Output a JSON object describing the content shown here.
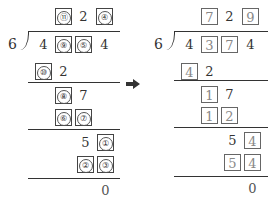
{
  "left": {
    "divisor": "6",
    "quotient": [
      "⑪",
      "2",
      "④"
    ],
    "quotient_boxed": [
      true,
      false,
      true
    ],
    "dividend": [
      "4",
      "⑨",
      "⑤",
      "4"
    ],
    "dividend_boxed": [
      false,
      true,
      true,
      false
    ],
    "step1": [
      "⑩",
      "2"
    ],
    "step1_boxed": [
      true,
      false
    ],
    "step2": [
      "⑧",
      "7"
    ],
    "step2_boxed": [
      true,
      false
    ],
    "step3": [
      "⑥",
      "⑦"
    ],
    "step3_boxed": [
      true,
      true
    ],
    "step4": [
      "5",
      "①"
    ],
    "step4_boxed": [
      false,
      true
    ],
    "step5": [
      "②",
      "③"
    ],
    "step5_boxed": [
      true,
      true
    ],
    "remainder": "0"
  },
  "arrow": {
    "icon": "right-arrow-icon",
    "color": "#333333"
  },
  "right": {
    "divisor": "6",
    "quotient": [
      "7",
      "2",
      "9"
    ],
    "quotient_boxed": [
      true,
      false,
      true
    ],
    "dividend": [
      "4",
      "3",
      "7",
      "4"
    ],
    "dividend_boxed": [
      false,
      true,
      true,
      false
    ],
    "step1": [
      "4",
      "2"
    ],
    "step1_boxed": [
      true,
      false
    ],
    "step2": [
      "1",
      "7"
    ],
    "step2_boxed": [
      true,
      false
    ],
    "step3": [
      "1",
      "2"
    ],
    "step3_boxed": [
      true,
      true
    ],
    "step4": [
      "5",
      "4"
    ],
    "step4_boxed": [
      false,
      true
    ],
    "step5": [
      "5",
      "4"
    ],
    "step5_boxed": [
      true,
      true
    ],
    "remainder": "0"
  }
}
